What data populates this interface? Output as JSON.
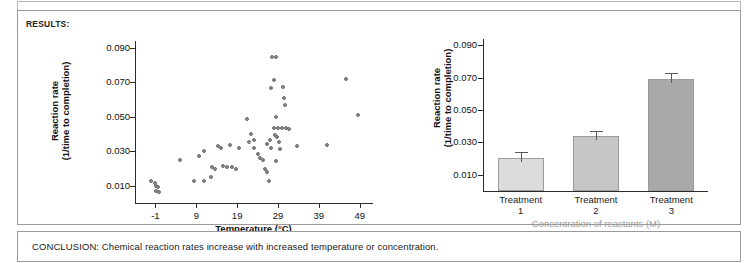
{
  "panel": {
    "results_label": "RESULTS:",
    "conclusion_text": "CONCLUSION: Chemical reaction rates increase with increased temperature or concentration."
  },
  "chart_data": [
    {
      "type": "scatter",
      "title": "",
      "xlabel": "Temperature (°C)",
      "ylabel": "Reaction rate\n(1/time to completion)",
      "ylabel_line1": "Reaction rate",
      "ylabel_line2": "(1/time to completion)",
      "xticks": [
        "-1",
        "9",
        "19",
        "29",
        "39",
        "49"
      ],
      "xtick_values": [
        -1,
        9,
        19,
        29,
        39,
        49
      ],
      "yticks": [
        "0.010",
        "0.030",
        "0.050",
        "0.070",
        "0.090"
      ],
      "ytick_values": [
        0.01,
        0.03,
        0.05,
        0.07,
        0.09
      ],
      "xlim": [
        -6,
        52
      ],
      "ylim": [
        0,
        0.094
      ],
      "grid": false,
      "legend": "none",
      "marker_color": "#8a8a8a",
      "points": [
        [
          -2.2,
          0.0128
        ],
        [
          -1.2,
          0.0118
        ],
        [
          -0.9,
          0.0098
        ],
        [
          -0.4,
          0.0092
        ],
        [
          -0.9,
          0.0072
        ],
        [
          -0.2,
          0.0062
        ],
        [
          5.0,
          0.0248
        ],
        [
          8.4,
          0.0128
        ],
        [
          10.8,
          0.0126
        ],
        [
          9.6,
          0.0272
        ],
        [
          11.0,
          0.03
        ],
        [
          12.8,
          0.0206
        ],
        [
          13.6,
          0.0196
        ],
        [
          14.2,
          0.033
        ],
        [
          15.0,
          0.0318
        ],
        [
          15.6,
          0.0214
        ],
        [
          16.4,
          0.0208
        ],
        [
          17.2,
          0.0336
        ],
        [
          17.8,
          0.0206
        ],
        [
          18.6,
          0.02
        ],
        [
          19.4,
          0.0322
        ],
        [
          12.6,
          0.0148
        ],
        [
          21.4,
          0.049
        ],
        [
          22.4,
          0.0398
        ],
        [
          22.0,
          0.0352
        ],
        [
          23.2,
          0.0368
        ],
        [
          23.0,
          0.032
        ],
        [
          24.0,
          0.0284
        ],
        [
          24.6,
          0.0262
        ],
        [
          25.4,
          0.0248
        ],
        [
          25.8,
          0.0196
        ],
        [
          26.4,
          0.0178
        ],
        [
          26.8,
          0.013
        ],
        [
          27.6,
          0.0846
        ],
        [
          28.6,
          0.0848
        ],
        [
          28.0,
          0.0712
        ],
        [
          27.4,
          0.0666
        ],
        [
          30.2,
          0.0672
        ],
        [
          30.4,
          0.0608
        ],
        [
          30.8,
          0.0566
        ],
        [
          28.4,
          0.0498
        ],
        [
          28.0,
          0.0436
        ],
        [
          29.0,
          0.0436
        ],
        [
          30.0,
          0.0436
        ],
        [
          30.9,
          0.0434
        ],
        [
          31.6,
          0.0432
        ],
        [
          28.2,
          0.0392
        ],
        [
          28.8,
          0.0382
        ],
        [
          29.2,
          0.0354
        ],
        [
          27.0,
          0.0366
        ],
        [
          26.2,
          0.0342
        ],
        [
          27.2,
          0.0318
        ],
        [
          29.4,
          0.0314
        ],
        [
          28.6,
          0.0246
        ],
        [
          33.6,
          0.033
        ],
        [
          41.0,
          0.0336
        ],
        [
          45.6,
          0.0718
        ],
        [
          48.6,
          0.0508
        ]
      ]
    },
    {
      "type": "bar",
      "title": "",
      "xlabel": "Concentration of reactants (M)",
      "ylabel_line1": "Reaction rate",
      "ylabel_line2": "(1/time to completion)",
      "categories": [
        "Treatment 1",
        "Treatment 2",
        "Treatment 3"
      ],
      "category_lines": [
        [
          "Treatment",
          "1"
        ],
        [
          "Treatment",
          "2"
        ],
        [
          "Treatment",
          "3"
        ]
      ],
      "values": [
        0.0205,
        0.0343,
        0.0693
      ],
      "errors": [
        0.0035,
        0.003,
        0.0035
      ],
      "bar_colors": [
        "#dcdcdc",
        "#c6c6c6",
        "#a9a9a9"
      ],
      "yticks": [
        "0.010",
        "0.030",
        "0.050",
        "0.070",
        "0.090"
      ],
      "ytick_values": [
        0.01,
        0.03,
        0.05,
        0.07,
        0.09
      ],
      "ylim": [
        0,
        0.094
      ],
      "grid": false,
      "legend": "none"
    }
  ]
}
